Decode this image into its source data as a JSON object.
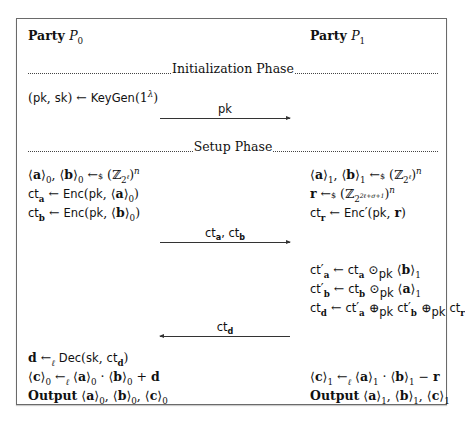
{
  "header": {
    "party0": "Party P₀",
    "party1": "Party P₁"
  },
  "phases": {
    "init": "Initialization Phase",
    "setup": "Setup Phase"
  },
  "init": {
    "p0_line1": "(pk, sk) ← KeyGen(1^λ)",
    "msg1": "pk",
    "msg1_direction": "P0 → P1"
  },
  "setup": {
    "p0_lines": [
      "⟨a⟩₀, ⟨b⟩₀ ←$ (ℤ_{2^ℓ})^n",
      "ct_a ← Enc(pk, ⟨a⟩₀)",
      "ct_b ← Enc(pk, ⟨b⟩₀)"
    ],
    "p1_lines": [
      "⟨a⟩₁, ⟨b⟩₁ ←$ (ℤ_{2^ℓ})^n",
      "r ←$ (ℤ_{2^{2ℓ+σ+1}})^n",
      "ct_r ← Enc′(pk, r)"
    ],
    "msg2": "ct_a, ct_b",
    "msg2_direction": "P0 → P1",
    "p1_compute": [
      "ct′_a ← ct_a ⊙_pk ⟨b⟩₁",
      "ct′_b ← ct_b ⊙_pk ⟨a⟩₁",
      "ct_d ← ct′_a ⊕_pk ct′_b ⊕_pk ct_r"
    ],
    "msg3": "ct_d",
    "msg3_direction": "P1 → P0",
    "p0_final": [
      "d ←_ℓ Dec(sk, ct_d)",
      "⟨c⟩₀ ←_ℓ ⟨a⟩₀ · ⟨b⟩₀ + d",
      "Output ⟨a⟩₀, ⟨b⟩₀, ⟨c⟩₀"
    ],
    "p1_final": [
      "⟨c⟩₁ ←_ℓ ⟨a⟩₁ · ⟨b⟩₁ − r",
      "Output ⟨a⟩₁, ⟨b⟩₁, ⟨c⟩₁"
    ]
  }
}
